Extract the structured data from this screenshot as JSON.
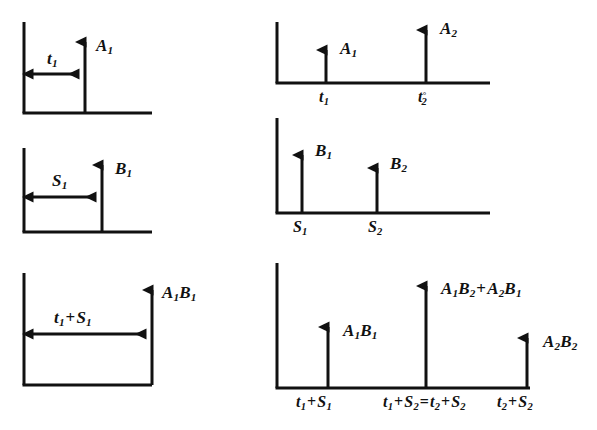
{
  "figure": {
    "background_color": "#ffffff",
    "ink_color": "#111111",
    "columns": 2,
    "rows": 3
  },
  "panels": [
    {
      "id": "left-top",
      "name": "panel-a1-single-impulse",
      "column": "left",
      "row": 1,
      "span_label": "t₁",
      "impulse_label": "A₁",
      "impulses": [
        {
          "position_label": "t₁",
          "amplitude_label": "A₁"
        }
      ]
    },
    {
      "id": "left-middle",
      "name": "panel-b1-single-impulse",
      "column": "left",
      "row": 2,
      "span_label": "S₁",
      "impulse_label": "B₁",
      "impulses": [
        {
          "position_label": "S₁",
          "amplitude_label": "B₁"
        }
      ]
    },
    {
      "id": "left-bottom",
      "name": "panel-a1b1-convolution",
      "column": "left",
      "row": 3,
      "span_label": "t₁ + S₁",
      "impulse_label": "A₁B₁",
      "impulses": [
        {
          "position_label": "t₁ + S₁",
          "amplitude_label": "A₁B₁"
        }
      ]
    },
    {
      "id": "right-top",
      "name": "panel-a-impulse-train",
      "column": "right",
      "row": 1,
      "impulses": [
        {
          "position_label": "t₁",
          "amplitude_label": "A₁"
        },
        {
          "position_label": "t₂°",
          "amplitude_label": "A₂"
        }
      ]
    },
    {
      "id": "right-middle",
      "name": "panel-b-impulse-train",
      "column": "right",
      "row": 2,
      "impulses": [
        {
          "position_label": "S₁",
          "amplitude_label": "B₁"
        },
        {
          "position_label": "S₂",
          "amplitude_label": "B₂"
        }
      ]
    },
    {
      "id": "right-bottom",
      "name": "panel-ab-convolution-train",
      "column": "right",
      "row": 3,
      "impulses": [
        {
          "position_label": "t₁ + S₁",
          "amplitude_label": "A₁B₁"
        },
        {
          "position_label": "t₁ + S₂ = t₂ + S₂",
          "amplitude_label": "A₁B₂ + A₂B₁"
        },
        {
          "position_label": "t₂ + S₂",
          "amplitude_label": "A₂B₂"
        }
      ]
    }
  ],
  "labels": {
    "lt_span": {
      "base": "t",
      "sub": "1"
    },
    "lt_amp": {
      "base": "A",
      "sub": "1"
    },
    "lm_span": {
      "base": "S",
      "sub": "1"
    },
    "lm_amp": {
      "base": "B",
      "sub": "1"
    },
    "lb_span_t": {
      "base": "t",
      "sub": "1"
    },
    "lb_span_s": {
      "base": "S",
      "sub": "1"
    },
    "lb_amp_a": {
      "base": "A",
      "sub": "1"
    },
    "lb_amp_b": {
      "base": "B",
      "sub": "1"
    },
    "rt_amp1": {
      "base": "A",
      "sub": "1"
    },
    "rt_amp2": {
      "base": "A",
      "sub": "2"
    },
    "rt_pos1": {
      "base": "t",
      "sub": "1"
    },
    "rt_pos2": {
      "base": "t",
      "sub": "2",
      "sup": "°"
    },
    "rm_amp1": {
      "base": "B",
      "sub": "1"
    },
    "rm_amp2": {
      "base": "B",
      "sub": "2"
    },
    "rm_pos1": {
      "base": "S",
      "sub": "1"
    },
    "rm_pos2": {
      "base": "S",
      "sub": "2"
    },
    "rb_amp1_a": {
      "base": "A",
      "sub": "1"
    },
    "rb_amp1_b": {
      "base": "B",
      "sub": "1"
    },
    "rb_amp2_a1": {
      "base": "A",
      "sub": "1"
    },
    "rb_amp2_b2": {
      "base": "B",
      "sub": "2"
    },
    "rb_amp2_a2": {
      "base": "A",
      "sub": "2"
    },
    "rb_amp2_b1": {
      "base": "B",
      "sub": "1"
    },
    "rb_amp3_a": {
      "base": "A",
      "sub": "2"
    },
    "rb_amp3_b": {
      "base": "B",
      "sub": "2"
    },
    "rb_pos1_t": {
      "base": "t",
      "sub": "1"
    },
    "rb_pos1_s": {
      "base": "S",
      "sub": "1"
    },
    "rb_pos2_t1": {
      "base": "t",
      "sub": "1"
    },
    "rb_pos2_s2": {
      "base": "S",
      "sub": "2"
    },
    "rb_pos2_t2": {
      "base": "t",
      "sub": "2"
    },
    "rb_pos2_s2b": {
      "base": "S",
      "sub": "2"
    },
    "rb_pos3_t": {
      "base": "t",
      "sub": "2"
    },
    "rb_pos3_s": {
      "base": "S",
      "sub": "2"
    },
    "plus": "+",
    "equals": "="
  },
  "geometry": {
    "stroke_width": 3,
    "arrow_head_width": 11,
    "arrow_head_height": 14
  }
}
